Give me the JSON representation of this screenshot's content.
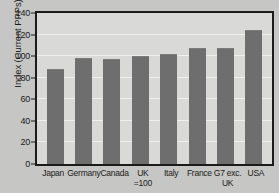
{
  "chart_data": {
    "type": "bar",
    "title": "",
    "subtitle": "",
    "xlabel": "",
    "ylabel": "Index (Current PPPs)",
    "ylim": [
      0,
      140
    ],
    "yticks": [
      0,
      20,
      40,
      60,
      80,
      100,
      120,
      140
    ],
    "ytick_labels": [
      "0",
      "20",
      "40",
      "60",
      "80",
      "100",
      "120",
      "140"
    ],
    "grid": true,
    "legend": false,
    "legend_position": "none",
    "categories": [
      "Japan",
      "Germany",
      "Canada",
      "UK =100",
      "Italy",
      "France",
      "G7 exc. UK",
      "USA"
    ],
    "category_lines": [
      {
        "line1": "Japan",
        "line2": ""
      },
      {
        "line1": "Germany",
        "line2": ""
      },
      {
        "line1": "Canada",
        "line2": ""
      },
      {
        "line1": "UK",
        "line2": "=100"
      },
      {
        "line1": "Italy",
        "line2": ""
      },
      {
        "line1": "France",
        "line2": ""
      },
      {
        "line1": "G7 exc.",
        "line2": "UK"
      },
      {
        "line1": "USA",
        "line2": ""
      }
    ],
    "values": [
      88,
      98,
      97,
      100,
      102,
      108,
      108,
      124
    ],
    "bar_color": "#6e6e6e",
    "plot_background": "#d9d9d7",
    "figure_background": "#c6c6c4",
    "axis_color": "#1b1b1b",
    "gridline_color": "#efefee"
  }
}
